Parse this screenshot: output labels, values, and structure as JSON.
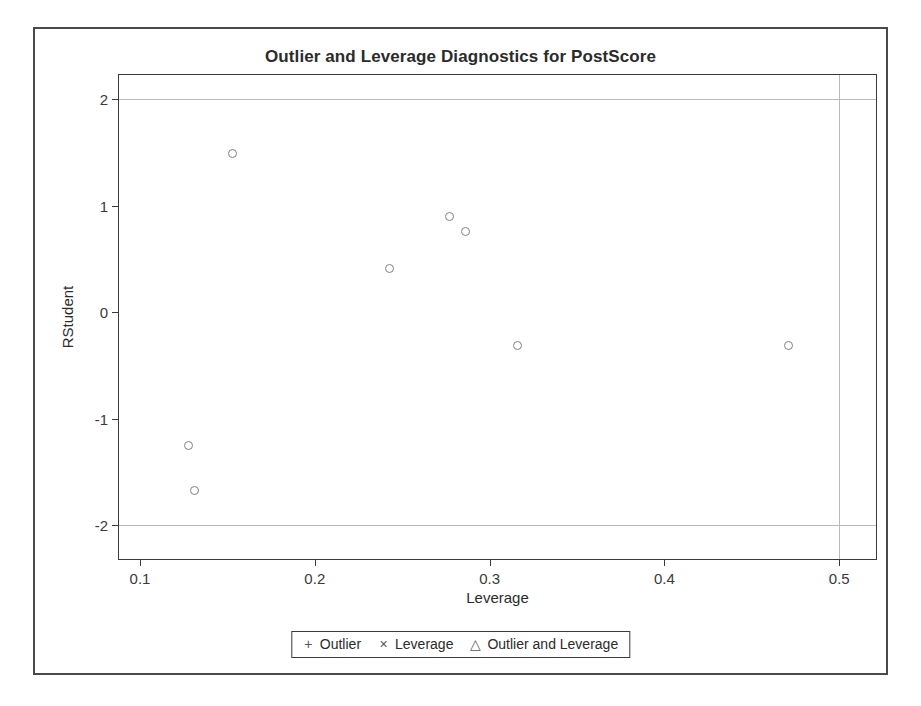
{
  "chart_data": {
    "type": "scatter",
    "title": "Outlier and Leverage Diagnostics for PostScore",
    "xlabel": "Leverage",
    "ylabel": "RStudent",
    "xlim": [
      0.088,
      0.521
    ],
    "ylim": [
      -2.32,
      2.23
    ],
    "xticks": [
      0.1,
      0.2,
      0.3,
      0.4,
      0.5
    ],
    "xtick_labels": [
      "0.1",
      "0.2",
      "0.3",
      "0.4",
      "0.5"
    ],
    "yticks": [
      2,
      1,
      0,
      -1,
      -2
    ],
    "ytick_labels": [
      "2",
      "1",
      "0",
      "-1",
      "-2"
    ],
    "grid": false,
    "reference_lines": {
      "horizontal": [
        2,
        -2
      ],
      "vertical": [
        0.5
      ]
    },
    "legend_position": "bottom",
    "series": [
      {
        "name": "Observations",
        "marker": "open-circle",
        "color": "#808086",
        "points": [
          {
            "x": 0.128,
            "y": -1.25
          },
          {
            "x": 0.131,
            "y": -1.68
          },
          {
            "x": 0.153,
            "y": 1.49
          },
          {
            "x": 0.243,
            "y": 0.41
          },
          {
            "x": 0.277,
            "y": 0.9
          },
          {
            "x": 0.286,
            "y": 0.76
          },
          {
            "x": 0.316,
            "y": -0.31
          },
          {
            "x": 0.471,
            "y": -0.31
          }
        ]
      }
    ],
    "legend": [
      {
        "symbol": "+",
        "label": "Outlier"
      },
      {
        "symbol": "×",
        "label": "Leverage"
      },
      {
        "symbol": "△",
        "label": "Outlier and Leverage"
      }
    ]
  },
  "colors": {
    "frame": "#4a4a4a",
    "axis": "#3a3a3a",
    "marker": "#808086",
    "reference_line": "#b9b9b9",
    "text": "#2b2b2b",
    "background": "#ffffff"
  }
}
